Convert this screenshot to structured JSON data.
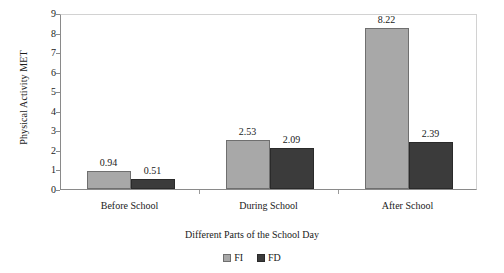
{
  "chart_data": {
    "type": "bar",
    "title": "",
    "xlabel": "Different Parts of the School Day",
    "ylabel": "Physical Activity MET",
    "categories": [
      "Before School",
      "During School",
      "After School"
    ],
    "series": [
      {
        "name": "FI",
        "values": [
          0.94,
          2.53,
          8.22
        ],
        "color": "#a8a8a8"
      },
      {
        "name": "FD",
        "values": [
          0.51,
          2.09,
          2.39
        ],
        "color": "#3b3b3b"
      }
    ],
    "ylim": [
      0,
      9
    ],
    "yticks": [
      "0",
      "1",
      "2",
      "3",
      "4",
      "5",
      "6",
      "7",
      "8",
      "9"
    ],
    "grid": false,
    "legend_position": "bottom",
    "value_labels": [
      [
        "0.94",
        "0.51"
      ],
      [
        "2.53",
        "2.09"
      ],
      [
        "8.22",
        "2.39"
      ]
    ]
  },
  "legend": {
    "entries": [
      {
        "label": "FI",
        "swatch": "light-gray-swatch"
      },
      {
        "label": "FD",
        "swatch": "dark-gray-swatch"
      }
    ]
  }
}
